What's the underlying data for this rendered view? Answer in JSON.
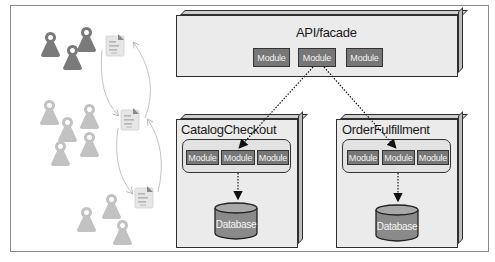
{
  "diagram": {
    "facade": {
      "title": "API/facade",
      "modules": [
        "Module",
        "Module",
        "Module"
      ]
    },
    "services": [
      {
        "title": "CatalogCheckout",
        "modules": [
          "Module",
          "Module",
          "Module"
        ],
        "database": "Database"
      },
      {
        "title": "OrderFulfillment",
        "modules": [
          "Module",
          "Module",
          "Module"
        ],
        "database": "Database"
      }
    ],
    "left_panel": {
      "user_groups": [
        {
          "count": 3,
          "shade": "dark"
        },
        {
          "count": 5,
          "shade": "light"
        },
        {
          "count": 3,
          "shade": "light"
        }
      ],
      "documents": 3,
      "icons": [
        "person-icon",
        "document-icon",
        "curved-arrow-icon"
      ]
    },
    "colors": {
      "box_fill": "#ebebeb",
      "inner_fill": "#e2e2e2",
      "module_fill": "#777777",
      "db_fill": "#8a8a8a",
      "person_dark": "#7a7a7a",
      "person_light": "#bdbdbd",
      "arrow": "#1a1a1a"
    }
  }
}
